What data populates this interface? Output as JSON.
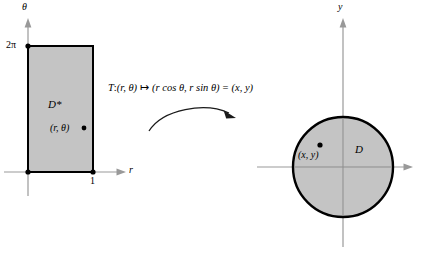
{
  "figure": {
    "type": "polar-coordinate-transformation-diagram",
    "background_color": "#ffffff",
    "fill_color": "#c4c4c4",
    "border_color": "#000000",
    "axis_color": "#999999"
  },
  "domain_panel": {
    "region_label": "D*",
    "point_label": "(r, θ)",
    "vertical_axis_label": "θ",
    "horizontal_axis_label": "r",
    "vertical_tick_label": "2π",
    "horizontal_tick_label": "1",
    "rect": {
      "left": 28,
      "right": 93,
      "top": 46,
      "bottom": 172
    }
  },
  "transformation": {
    "map_name": "T",
    "formula": "T:(r, θ) ↦ (r cos θ, r sin θ) = (x, y)",
    "formula_parts": {
      "name": "T",
      "colon": ":",
      "input": "(r, θ)",
      "maps_to": "↦",
      "output": "(r cos θ, r sin θ)",
      "equals": "=",
      "result": "(x, y)"
    },
    "arrow": "curved-arrow-right"
  },
  "image_panel": {
    "region_label": "D",
    "point_label": "(x, y)",
    "vertical_axis_label": "y",
    "circle": {
      "cx": 343,
      "cy": 167,
      "r": 50
    }
  }
}
